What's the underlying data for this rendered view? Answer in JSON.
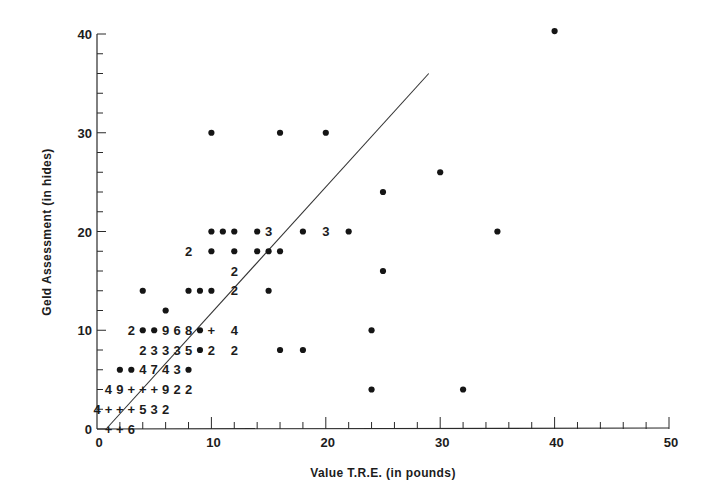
{
  "chart_data": {
    "type": "scatter",
    "title": "",
    "xlabel": "Value T.R.E. (in pounds)",
    "ylabel": "Geld Assessment (in hides)",
    "xlim": [
      0,
      50
    ],
    "ylim": [
      0,
      40
    ],
    "x_ticks": [
      0,
      10,
      20,
      30,
      40,
      50
    ],
    "y_ticks": [
      0,
      10,
      20,
      30,
      40
    ],
    "x_minor_step": 2,
    "y_minor_step": 2,
    "grid": false,
    "legend": null,
    "note": "Plotted symbols are dots (single observation), '+' (overlapping), or digits giving the count of coincident observations.",
    "points": [
      {
        "x": 40,
        "y": 40.3,
        "symbol": "dot"
      },
      {
        "x": 10,
        "y": 30,
        "symbol": "dot"
      },
      {
        "x": 16,
        "y": 30,
        "symbol": "dot"
      },
      {
        "x": 20,
        "y": 30,
        "symbol": "dot"
      },
      {
        "x": 30,
        "y": 26,
        "symbol": "dot"
      },
      {
        "x": 25,
        "y": 24,
        "symbol": "dot"
      },
      {
        "x": 10,
        "y": 20,
        "symbol": "dot"
      },
      {
        "x": 11,
        "y": 20,
        "symbol": "dot"
      },
      {
        "x": 12,
        "y": 20,
        "symbol": "dot"
      },
      {
        "x": 14,
        "y": 20,
        "symbol": "dot"
      },
      {
        "x": 15,
        "y": 20,
        "symbol": "3"
      },
      {
        "x": 18,
        "y": 20,
        "symbol": "dot"
      },
      {
        "x": 20,
        "y": 20,
        "symbol": "3"
      },
      {
        "x": 22,
        "y": 20,
        "symbol": "dot"
      },
      {
        "x": 35,
        "y": 20,
        "symbol": "dot"
      },
      {
        "x": 8,
        "y": 18,
        "symbol": "2"
      },
      {
        "x": 10,
        "y": 18,
        "symbol": "dot"
      },
      {
        "x": 12,
        "y": 18,
        "symbol": "dot"
      },
      {
        "x": 14,
        "y": 18,
        "symbol": "dot"
      },
      {
        "x": 15,
        "y": 18,
        "symbol": "dot"
      },
      {
        "x": 16,
        "y": 18,
        "symbol": "dot"
      },
      {
        "x": 12,
        "y": 16,
        "symbol": "2"
      },
      {
        "x": 25,
        "y": 16,
        "symbol": "dot"
      },
      {
        "x": 4,
        "y": 14,
        "symbol": "dot"
      },
      {
        "x": 8,
        "y": 14,
        "symbol": "dot"
      },
      {
        "x": 9,
        "y": 14,
        "symbol": "dot"
      },
      {
        "x": 10,
        "y": 14,
        "symbol": "dot"
      },
      {
        "x": 12,
        "y": 14,
        "symbol": "2"
      },
      {
        "x": 15,
        "y": 14,
        "symbol": "dot"
      },
      {
        "x": 6,
        "y": 12,
        "symbol": "dot"
      },
      {
        "x": 3,
        "y": 10,
        "symbol": "2"
      },
      {
        "x": 4,
        "y": 10,
        "symbol": "dot"
      },
      {
        "x": 5,
        "y": 10,
        "symbol": "dot"
      },
      {
        "x": 6,
        "y": 10,
        "symbol": "9"
      },
      {
        "x": 7,
        "y": 10,
        "symbol": "6"
      },
      {
        "x": 8,
        "y": 10,
        "symbol": "8"
      },
      {
        "x": 9,
        "y": 10,
        "symbol": "dot"
      },
      {
        "x": 10,
        "y": 10,
        "symbol": "+"
      },
      {
        "x": 12,
        "y": 10,
        "symbol": "4"
      },
      {
        "x": 24,
        "y": 10,
        "symbol": "dot"
      },
      {
        "x": 4,
        "y": 8,
        "symbol": "2"
      },
      {
        "x": 5,
        "y": 8,
        "symbol": "3"
      },
      {
        "x": 6,
        "y": 8,
        "symbol": "3"
      },
      {
        "x": 7,
        "y": 8,
        "symbol": "3"
      },
      {
        "x": 8,
        "y": 8,
        "symbol": "5"
      },
      {
        "x": 9,
        "y": 8,
        "symbol": "dot"
      },
      {
        "x": 10,
        "y": 8,
        "symbol": "2"
      },
      {
        "x": 12,
        "y": 8,
        "symbol": "2"
      },
      {
        "x": 16,
        "y": 8,
        "symbol": "dot"
      },
      {
        "x": 18,
        "y": 8,
        "symbol": "dot"
      },
      {
        "x": 2,
        "y": 6,
        "symbol": "dot"
      },
      {
        "x": 3,
        "y": 6,
        "symbol": "dot"
      },
      {
        "x": 4,
        "y": 6,
        "symbol": "4"
      },
      {
        "x": 5,
        "y": 6,
        "symbol": "7"
      },
      {
        "x": 6,
        "y": 6,
        "symbol": "4"
      },
      {
        "x": 7,
        "y": 6,
        "symbol": "3"
      },
      {
        "x": 8,
        "y": 6,
        "symbol": "dot"
      },
      {
        "x": 1,
        "y": 4,
        "symbol": "4"
      },
      {
        "x": 2,
        "y": 4,
        "symbol": "9"
      },
      {
        "x": 3,
        "y": 4,
        "symbol": "+"
      },
      {
        "x": 4,
        "y": 4,
        "symbol": "+"
      },
      {
        "x": 5,
        "y": 4,
        "symbol": "+"
      },
      {
        "x": 6,
        "y": 4,
        "symbol": "9"
      },
      {
        "x": 7,
        "y": 4,
        "symbol": "2"
      },
      {
        "x": 8,
        "y": 4,
        "symbol": "2"
      },
      {
        "x": 24,
        "y": 4,
        "symbol": "dot"
      },
      {
        "x": 32,
        "y": 4,
        "symbol": "dot"
      },
      {
        "x": 0,
        "y": 2,
        "symbol": "4"
      },
      {
        "x": 1,
        "y": 2,
        "symbol": "+"
      },
      {
        "x": 2,
        "y": 2,
        "symbol": "+"
      },
      {
        "x": 3,
        "y": 2,
        "symbol": "+"
      },
      {
        "x": 4,
        "y": 2,
        "symbol": "5"
      },
      {
        "x": 5,
        "y": 2,
        "symbol": "3"
      },
      {
        "x": 6,
        "y": 2,
        "symbol": "2"
      },
      {
        "x": 1,
        "y": 0,
        "symbol": "+"
      },
      {
        "x": 2,
        "y": 0,
        "symbol": "+"
      },
      {
        "x": 3,
        "y": 0,
        "symbol": "6"
      }
    ],
    "regression_line": {
      "x1": 0.8,
      "y1": 0,
      "x2": 29,
      "y2": 36
    }
  }
}
